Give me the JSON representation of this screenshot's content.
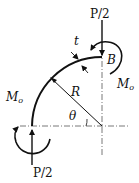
{
  "diagram": {
    "type": "curved-beam quarter ring",
    "labels": {
      "load_top": "P/2",
      "load_bottom": "P/2",
      "moment_top": "M",
      "moment_top_sub": "o",
      "moment_left": "M",
      "moment_left_sub": "o",
      "thickness": "t",
      "radius": "R",
      "angle": "θ",
      "point": "B"
    },
    "colors": {
      "stroke": "#111111",
      "background": "#ffffff"
    }
  }
}
